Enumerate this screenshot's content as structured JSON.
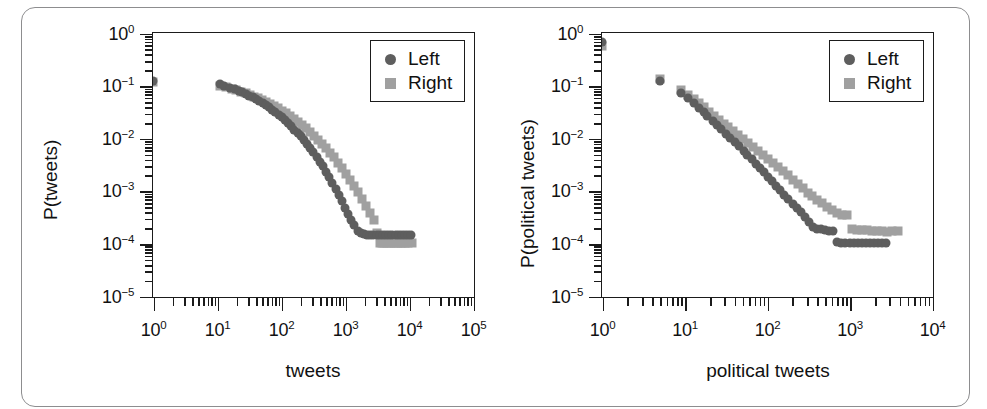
{
  "figure": {
    "background": "#ffffff",
    "border_color": "#8d8d8f"
  },
  "series_style": {
    "left_color": "#5e5e5e",
    "right_color": "#a0a0a0"
  },
  "chart_data": [
    {
      "type": "scatter",
      "panel": "left",
      "title": "",
      "xlabel": "tweets",
      "ylabel": "P(tweets)",
      "xscale": "log",
      "yscale": "log",
      "xlim": [
        1,
        100000
      ],
      "ylim": [
        1e-05,
        1
      ],
      "grid": false,
      "legend_position": "top-right",
      "xticks": [
        "10^0",
        "10^1",
        "10^2",
        "10^3",
        "10^4",
        "10^5"
      ],
      "yticks": [
        "10^0",
        "10^-1",
        "10^-2",
        "10^-3",
        "10^-4",
        "10^-5"
      ],
      "series": [
        {
          "name": "Left",
          "marker": "circle",
          "color": "#5e5e5e",
          "points": [
            [
              1,
              0.125
            ],
            [
              11,
              0.105
            ],
            [
              13,
              0.098
            ],
            [
              16,
              0.092
            ],
            [
              19,
              0.086
            ],
            [
              22,
              0.08
            ],
            [
              25,
              0.074
            ],
            [
              28,
              0.069
            ],
            [
              32,
              0.064
            ],
            [
              36,
              0.06
            ],
            [
              41,
              0.055
            ],
            [
              46,
              0.051
            ],
            [
              52,
              0.047
            ],
            [
              58,
              0.043
            ],
            [
              65,
              0.039
            ],
            [
              73,
              0.035
            ],
            [
              82,
              0.031
            ],
            [
              92,
              0.028
            ],
            [
              103,
              0.025
            ],
            [
              115,
              0.022
            ],
            [
              129,
              0.0193
            ],
            [
              145,
              0.0168
            ],
            [
              162,
              0.0146
            ],
            [
              182,
              0.0126
            ],
            [
              204,
              0.0108
            ],
            [
              228,
              0.0092
            ],
            [
              256,
              0.0078
            ],
            [
              287,
              0.0065
            ],
            [
              321,
              0.0054
            ],
            [
              360,
              0.0044
            ],
            [
              403,
              0.0036
            ],
            [
              452,
              0.0029
            ],
            [
              506,
              0.0023
            ],
            [
              567,
              0.00182
            ],
            [
              635,
              0.00142
            ],
            [
              712,
              0.0011
            ],
            [
              797,
              0.00085
            ],
            [
              893,
              0.00064
            ],
            [
              1001,
              0.00048
            ],
            [
              1121,
              0.00036
            ],
            [
              1256,
              0.00028
            ],
            [
              1407,
              0.00022
            ],
            [
              1577,
              0.000175
            ],
            [
              1766,
              0.000155
            ],
            [
              1979,
              0.000148
            ],
            [
              2217,
              0.000145
            ],
            [
              2484,
              0.000145
            ],
            [
              2783,
              0.000145
            ],
            [
              3118,
              0.000145
            ],
            [
              3493,
              0.000145
            ],
            [
              3914,
              0.000145
            ],
            [
              4385,
              0.000145
            ],
            [
              4913,
              0.000145
            ],
            [
              5505,
              0.000145
            ],
            [
              6168,
              0.000145
            ],
            [
              6910,
              0.000145
            ],
            [
              7742,
              0.000145
            ],
            [
              8674,
              0.000145
            ],
            [
              9719,
              0.000145
            ],
            [
              10888,
              0.000145
            ]
          ]
        },
        {
          "name": "Right",
          "marker": "square",
          "color": "#a0a0a0",
          "points": [
            [
              1,
              0.118
            ],
            [
              11,
              0.1
            ],
            [
              14,
              0.093
            ],
            [
              17,
              0.087
            ],
            [
              20,
              0.082
            ],
            [
              24,
              0.077
            ],
            [
              28,
              0.072
            ],
            [
              33,
              0.067
            ],
            [
              38,
              0.062
            ],
            [
              44,
              0.058
            ],
            [
              51,
              0.053
            ],
            [
              59,
              0.049
            ],
            [
              68,
              0.045
            ],
            [
              79,
              0.041
            ],
            [
              91,
              0.037
            ],
            [
              105,
              0.033
            ],
            [
              121,
              0.0295
            ],
            [
              140,
              0.0262
            ],
            [
              161,
              0.0231
            ],
            [
              186,
              0.0203
            ],
            [
              214,
              0.0177
            ],
            [
              247,
              0.0153
            ],
            [
              285,
              0.0131
            ],
            [
              328,
              0.0112
            ],
            [
              379,
              0.0094
            ],
            [
              437,
              0.0079
            ],
            [
              504,
              0.0065
            ],
            [
              581,
              0.0053
            ],
            [
              670,
              0.0043
            ],
            [
              773,
              0.0034
            ],
            [
              891,
              0.0027
            ],
            [
              1028,
              0.0021
            ],
            [
              1185,
              0.00162
            ],
            [
              1367,
              0.00124
            ],
            [
              1577,
              0.00094
            ],
            [
              1818,
              0.0007
            ],
            [
              2097,
              0.00052
            ],
            [
              2418,
              0.00038
            ],
            [
              2789,
              0.00028
            ],
            [
              3216,
              0.000155
            ],
            [
              3500,
              0.0001
            ],
            [
              3800,
              0.0001
            ],
            [
              4100,
              0.0001
            ],
            [
              4500,
              0.0001
            ],
            [
              4900,
              0.0001
            ],
            [
              5300,
              0.0001
            ],
            [
              5800,
              0.0001
            ],
            [
              6300,
              0.0001
            ],
            [
              6800,
              0.0001
            ],
            [
              7400,
              0.0001
            ],
            [
              8000,
              0.0001
            ],
            [
              8700,
              0.0001
            ],
            [
              9500,
              0.0001
            ],
            [
              11000,
              0.0001
            ]
          ]
        }
      ],
      "legend": [
        {
          "label": "Left",
          "marker": "circle",
          "color": "#5e5e5e"
        },
        {
          "label": "Right",
          "marker": "square",
          "color": "#a0a0a0"
        }
      ]
    },
    {
      "type": "scatter",
      "panel": "right",
      "title": "",
      "xlabel": "political tweets",
      "ylabel": "P(political tweets)",
      "xscale": "log",
      "yscale": "log",
      "xlim": [
        1,
        10000
      ],
      "ylim": [
        1e-05,
        1
      ],
      "grid": false,
      "legend_position": "top-right",
      "xticks": [
        "10^0",
        "10^1",
        "10^2",
        "10^3",
        "10^4"
      ],
      "yticks": [
        "10^0",
        "10^-1",
        "10^-2",
        "10^-3",
        "10^-4",
        "10^-5"
      ],
      "series": [
        {
          "name": "Left",
          "marker": "circle",
          "color": "#5e5e5e",
          "points": [
            [
              1,
              0.68
            ],
            [
              5,
              0.125
            ],
            [
              9,
              0.072
            ],
            [
              11,
              0.058
            ],
            [
              13,
              0.046
            ],
            [
              15,
              0.038
            ],
            [
              17,
              0.031
            ],
            [
              19,
              0.026
            ],
            [
              22,
              0.0215
            ],
            [
              25,
              0.0178
            ],
            [
              28,
              0.0148
            ],
            [
              32,
              0.0122
            ],
            [
              36,
              0.0101
            ],
            [
              41,
              0.0084
            ],
            [
              46,
              0.007
            ],
            [
              52,
              0.0058
            ],
            [
              58,
              0.0048
            ],
            [
              65,
              0.004
            ],
            [
              73,
              0.0033
            ],
            [
              82,
              0.0027
            ],
            [
              92,
              0.00225
            ],
            [
              103,
              0.00185
            ],
            [
              115,
              0.00152
            ],
            [
              129,
              0.00125
            ],
            [
              145,
              0.00103
            ],
            [
              162,
              0.00085
            ],
            [
              182,
              0.0007
            ],
            [
              204,
              0.00057
            ],
            [
              228,
              0.00047
            ],
            [
              256,
              0.00039
            ],
            [
              287,
              0.00032
            ],
            [
              321,
              0.000255
            ],
            [
              360,
              0.000205
            ],
            [
              403,
              0.00019
            ],
            [
              452,
              0.000185
            ],
            [
              506,
              0.00018
            ],
            [
              567,
              0.000175
            ],
            [
              635,
              0.00017
            ],
            [
              712,
              0.000105
            ],
            [
              797,
              0.0001
            ],
            [
              893,
              0.0001
            ],
            [
              1001,
              0.0001
            ],
            [
              1121,
              0.0001
            ],
            [
              1256,
              0.0001
            ],
            [
              1407,
              0.0001
            ],
            [
              1577,
              0.0001
            ],
            [
              1766,
              0.0001
            ],
            [
              1979,
              0.0001
            ],
            [
              2217,
              0.0001
            ],
            [
              2484,
              0.0001
            ],
            [
              2783,
              0.0001
            ]
          ]
        },
        {
          "name": "Right",
          "marker": "square",
          "color": "#a0a0a0",
          "points": [
            [
              1,
              0.57
            ],
            [
              5,
              0.135
            ],
            [
              9,
              0.082
            ],
            [
              11,
              0.066
            ],
            [
              13,
              0.055
            ],
            [
              15,
              0.046
            ],
            [
              17,
              0.039
            ],
            [
              20,
              0.032
            ],
            [
              23,
              0.0268
            ],
            [
              26,
              0.0225
            ],
            [
              30,
              0.019
            ],
            [
              34,
              0.016
            ],
            [
              39,
              0.0135
            ],
            [
              45,
              0.0113
            ],
            [
              51,
              0.0096
            ],
            [
              59,
              0.0081
            ],
            [
              68,
              0.0068
            ],
            [
              78,
              0.0057
            ],
            [
              89,
              0.0048
            ],
            [
              102,
              0.004
            ],
            [
              117,
              0.0034
            ],
            [
              135,
              0.0028
            ],
            [
              155,
              0.00235
            ],
            [
              178,
              0.00196
            ],
            [
              204,
              0.00163
            ],
            [
              235,
              0.00135
            ],
            [
              270,
              0.00112
            ],
            [
              310,
              0.00092
            ],
            [
              356,
              0.00078
            ],
            [
              409,
              0.00068
            ],
            [
              470,
              0.00058
            ],
            [
              540,
              0.0005
            ],
            [
              620,
              0.00043
            ],
            [
              713,
              0.00038
            ],
            [
              819,
              0.00035
            ],
            [
              941,
              0.00034
            ],
            [
              1081,
              0.000185
            ],
            [
              1242,
              0.00018
            ],
            [
              1427,
              0.000178
            ],
            [
              1640,
              0.000176
            ],
            [
              1884,
              0.000174
            ],
            [
              2165,
              0.000172
            ],
            [
              2487,
              0.00017
            ],
            [
              2858,
              0.000168
            ],
            [
              3283,
              0.00017
            ],
            [
              3900,
              0.00017
            ]
          ]
        }
      ],
      "legend": [
        {
          "label": "Left",
          "marker": "circle",
          "color": "#5e5e5e"
        },
        {
          "label": "Right",
          "marker": "square",
          "color": "#a0a0a0"
        }
      ]
    }
  ]
}
